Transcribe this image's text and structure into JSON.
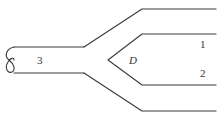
{
  "diagram": {
    "type": "pipe-junction",
    "labels": {
      "pipe_main": "3",
      "junction": "D",
      "branch_upper": "1",
      "branch_lower": "2"
    },
    "colors": {
      "stroke": "#3a3a3a",
      "text": "#333333",
      "background": "#ffffff"
    }
  }
}
